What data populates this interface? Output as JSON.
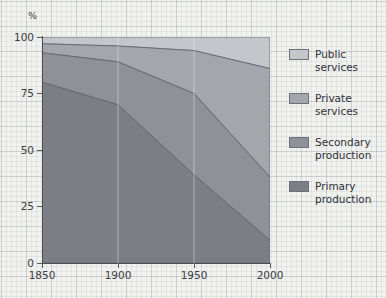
{
  "chart_data": {
    "type": "area",
    "title": "",
    "subtitle": "",
    "xlabel": "",
    "ylabel": "%",
    "x": [
      1850,
      1900,
      1950,
      2000
    ],
    "xtick_labels": [
      "1850",
      "1900",
      "1950",
      "2000"
    ],
    "ytick_labels": [
      "0",
      "25",
      "50",
      "75",
      "100"
    ],
    "yticks": [
      0,
      25,
      50,
      75,
      100
    ],
    "ylim": [
      0,
      100
    ],
    "xlim": [
      1850,
      2000
    ],
    "stacked": true,
    "grid": true,
    "legend_position": "right",
    "series": [
      {
        "name": "Primary production",
        "values": [
          80,
          70,
          39,
          10
        ],
        "color": "#7b7f85"
      },
      {
        "name": "Secondary production",
        "values": [
          13,
          19,
          36,
          28
        ],
        "color": "#8e9298"
      },
      {
        "name": "Private services",
        "values": [
          4,
          7,
          19,
          48
        ],
        "color": "#a3a7ac"
      },
      {
        "name": "Public services",
        "values": [
          3,
          4,
          6,
          14
        ],
        "color": "#c3c6ca"
      }
    ],
    "cumulative_tops": {
      "primary": [
        80,
        70,
        39,
        10
      ],
      "secondary": [
        93,
        89,
        75,
        38
      ],
      "private": [
        97,
        96,
        94,
        86
      ],
      "public": [
        100,
        100,
        100,
        100
      ]
    }
  },
  "legend": {
    "items": [
      {
        "label": "Public\nservices",
        "color": "#c3c6ca"
      },
      {
        "label": "Private\nservices",
        "color": "#a3a7ac"
      },
      {
        "label": "Secondary\nproduction",
        "color": "#8e9298"
      },
      {
        "label": "Primary\nproduction",
        "color": "#7b7f85"
      }
    ]
  },
  "axes": {
    "y_title": "%",
    "y_labels": [
      "100",
      "75",
      "50",
      "25",
      "0"
    ],
    "x_labels": [
      "1850",
      "1900",
      "1950",
      "2000"
    ]
  },
  "colors": {
    "background": "#f1f1ee",
    "grid_minor": "#a0a5af",
    "grid_major": "#969ba5",
    "axis": "#4c4f55",
    "text": "#3a3d42",
    "band_primary": "#7b7f85",
    "band_secondary": "#8e9298",
    "band_private": "#a3a7ac",
    "band_public": "#c3c6ca"
  }
}
